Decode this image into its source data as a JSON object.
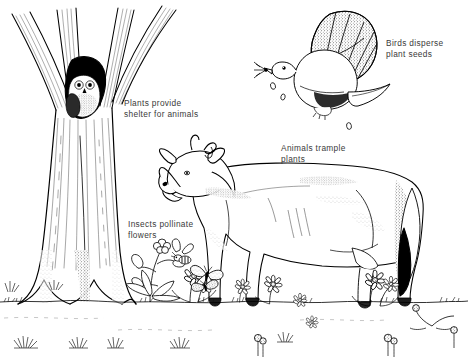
{
  "illustration": {
    "title": "Plants and animals depend on each other",
    "style": "black-and-white pen-and-ink line drawing",
    "background_color": "#ffffff",
    "ink_color": "#000000",
    "caption_color": "#3a3a3a"
  },
  "captions": [
    {
      "id": "shelter",
      "text": "Plants provide\nshelter for animals",
      "subject": "owl-in-tree-hollow"
    },
    {
      "id": "birds",
      "text": "Birds disperse\nplant seeds",
      "subject": "flying-bird"
    },
    {
      "id": "trample",
      "text": "Animals trample\nplants",
      "subject": "cow"
    },
    {
      "id": "insects",
      "text": "Insects pollinate\nflowers",
      "subject": "bee-and-butterfly"
    }
  ],
  "elements": {
    "tree": {
      "name": "tree",
      "branches": 4,
      "hollow": true,
      "position": "left"
    },
    "owl": {
      "name": "owl",
      "location": "tree hollow"
    },
    "bird": {
      "name": "bird",
      "action": "flying, carrying seeds",
      "seeds_falling": 3,
      "position": "top right"
    },
    "cow": {
      "name": "cow",
      "facing": "left",
      "has_horns": true,
      "tail_color": "black",
      "position": "center right"
    },
    "bee": {
      "name": "bee",
      "position": "lower left of cow"
    },
    "butterflies": {
      "name": "butterfly",
      "count": 2
    },
    "flowers": {
      "name": "flowers",
      "type": "daisies and clover"
    },
    "ground": {
      "name": "ground-line",
      "grass_tufts": true
    }
  }
}
